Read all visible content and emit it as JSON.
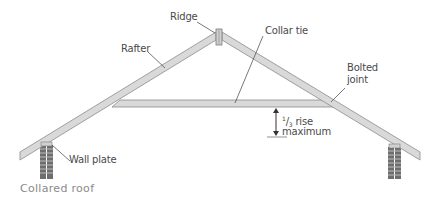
{
  "diagram": {
    "title": "Collared roof",
    "labels": {
      "ridge": "Ridge",
      "rafter": "Rafter",
      "collar_tie": "Collar tie",
      "bolted_joint_line1": "Bolted",
      "bolted_joint_line2": "joint",
      "rise_numerator": "1",
      "rise_slash": "/",
      "rise_denominator": "3",
      "rise_text": " rise",
      "rise_line2": "maximum",
      "wall_plate": "Wall plate"
    },
    "components": [
      "ridge board",
      "left rafter",
      "right rafter",
      "collar tie",
      "left wall plate",
      "right wall plate",
      "left brick pier",
      "right brick pier",
      "rise dimension arrow"
    ],
    "colors": {
      "timber_fill": "#d9d9d9",
      "timber_stroke": "#8c8c8c",
      "brick_fill": "#6e6e6e",
      "brick_mortar": "#bdbdbd",
      "leader_line": "#555555",
      "label_text": "#4a4a4a",
      "caption_text": "#8a8a8a"
    }
  }
}
